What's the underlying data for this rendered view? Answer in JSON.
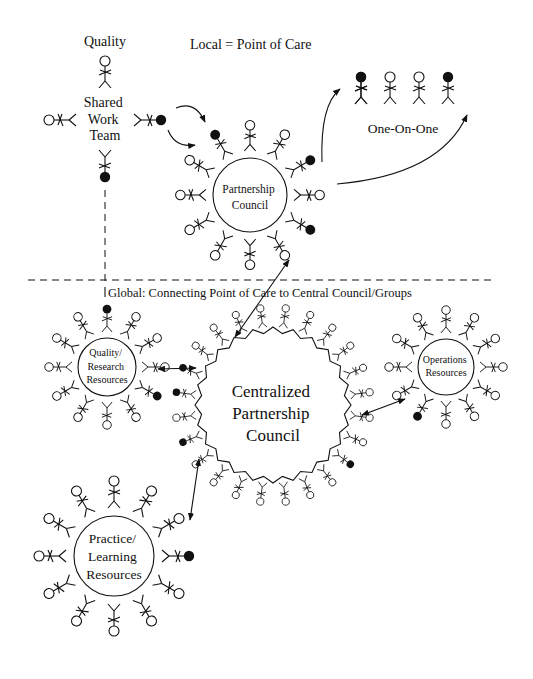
{
  "title": "Local = Point of Care",
  "global_label": "Global: Connecting Point of Care to Central Council/Groups",
  "colors": {
    "ink": "#111111",
    "background": "#ffffff"
  },
  "local": {
    "quality_label": "Quality",
    "shared_work_team": {
      "lines": [
        "Shared",
        "Work",
        "Team"
      ]
    },
    "partnership_council": {
      "lines": [
        "Partnership",
        "Council"
      ]
    },
    "one_on_one": {
      "label": "One-On-One",
      "figures": [
        "filled",
        "open",
        "open",
        "filled"
      ]
    }
  },
  "global": {
    "centralized_council": {
      "lines": [
        "Centralized",
        "Partnership",
        "Council"
      ]
    },
    "quality_research": {
      "lines": [
        "Quality/",
        "Research",
        "Resources"
      ]
    },
    "operations": {
      "lines": [
        "Operations",
        "Resources"
      ]
    },
    "practice_learning": {
      "lines": [
        "Practice/",
        "Learning",
        "Resources"
      ]
    }
  }
}
